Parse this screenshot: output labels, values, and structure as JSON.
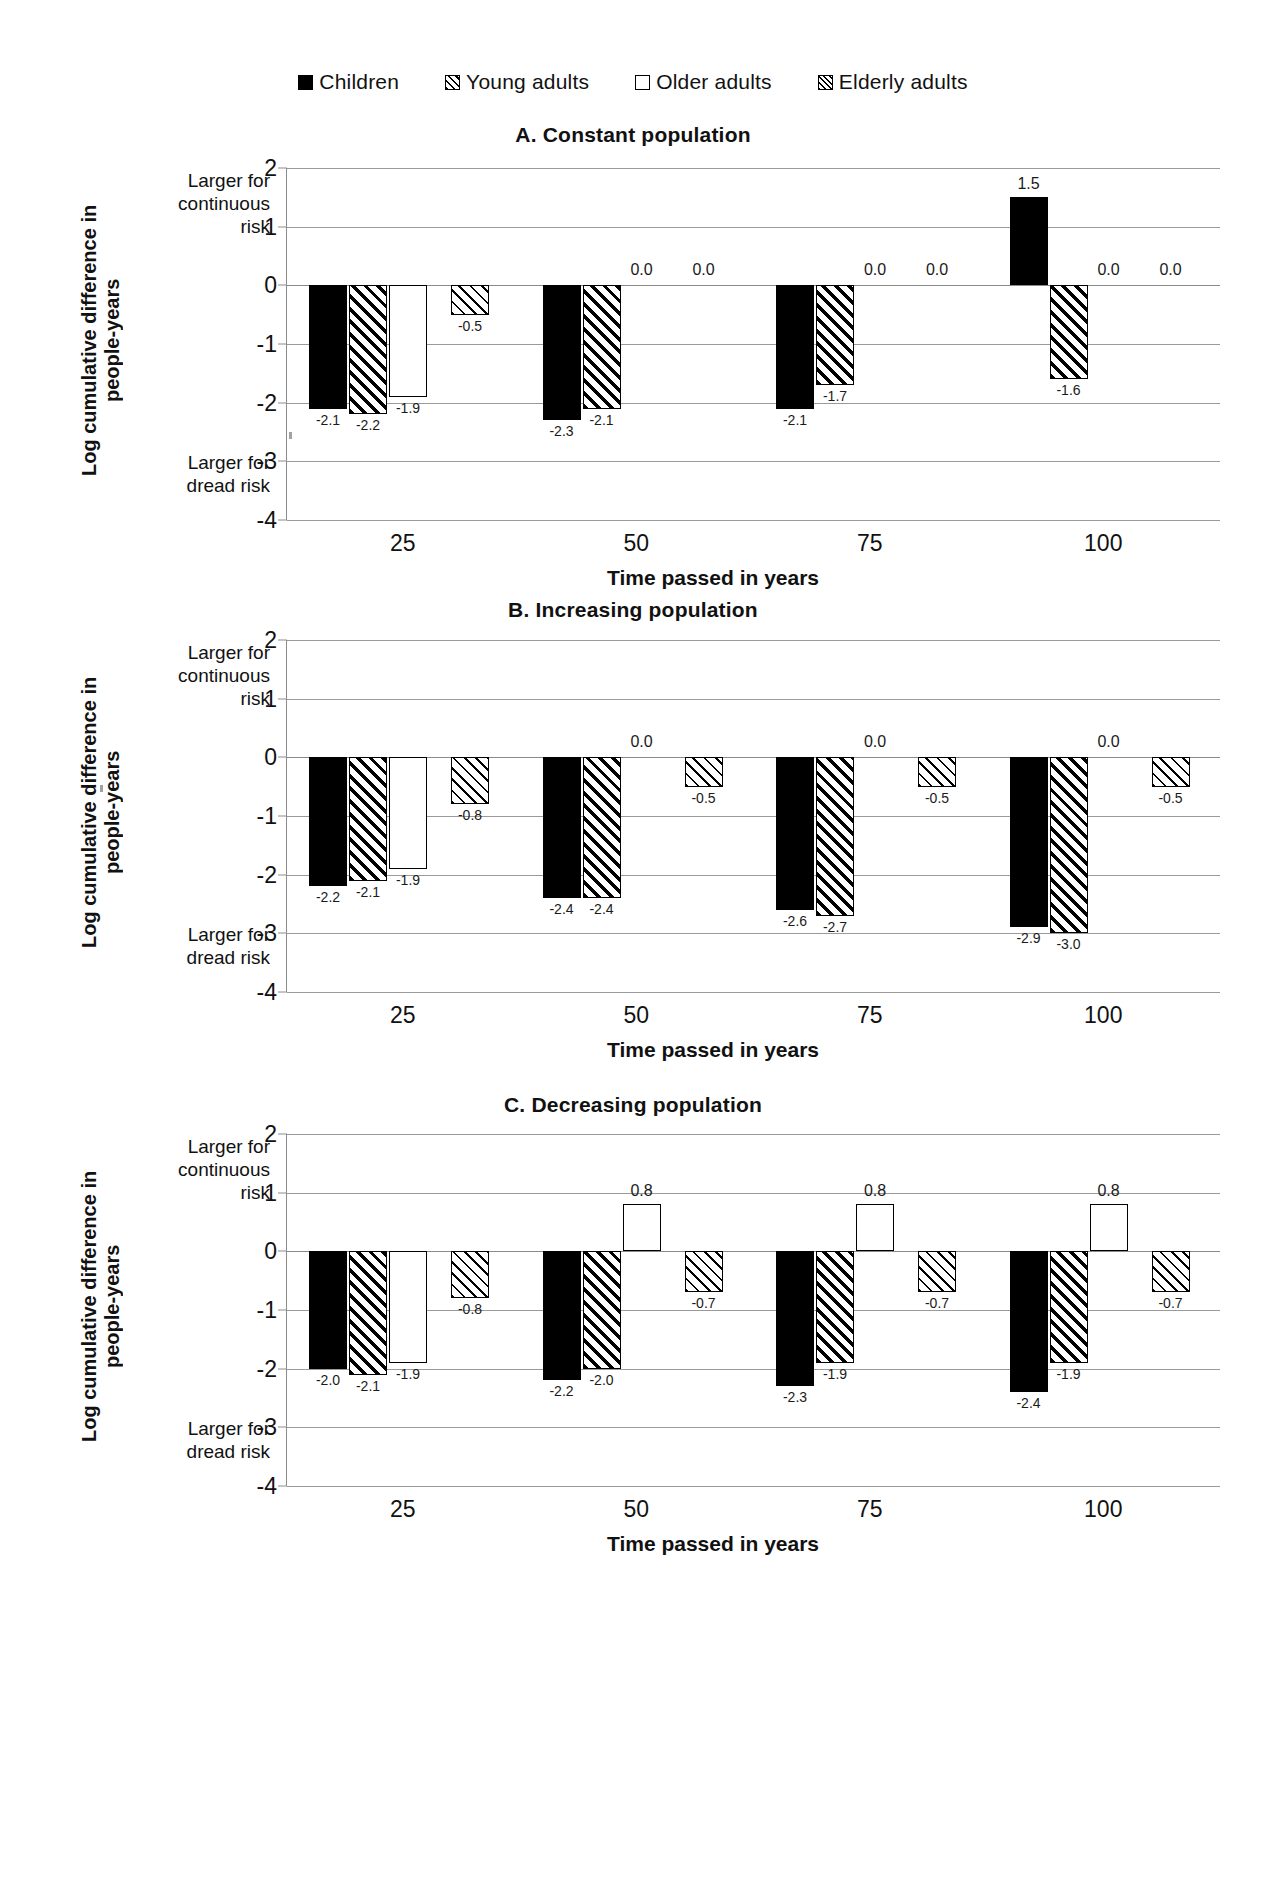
{
  "legend": {
    "items": [
      {
        "label": "Children",
        "pattern": "solid",
        "icon": "filled-square-icon"
      },
      {
        "label": "Young adults",
        "pattern": "diag",
        "icon": "diagonal-hatch-square-icon"
      },
      {
        "label": "Older adults",
        "pattern": "open",
        "icon": "empty-square-icon"
      },
      {
        "label": "Elderly adults",
        "pattern": "cross",
        "icon": "cross-hatch-square-icon"
      }
    ]
  },
  "axis": {
    "y_title": "Log cumulative difference in\npeople-years",
    "x_title": "Time passed in years",
    "top_annotation": "Larger for\ncontinuous\nrisk",
    "bottom_annotation": "Larger for\ndread risk",
    "yticks": [
      "2",
      "1",
      "0",
      "-1",
      "-2",
      "-3",
      "-4"
    ],
    "ytick_values": [
      2,
      1,
      0,
      -1,
      -2,
      -3,
      -4
    ],
    "xticks": [
      "25",
      "50",
      "75",
      "100"
    ]
  },
  "chart_data": [
    {
      "type": "bar",
      "panel": "A",
      "title": "A. Constant population",
      "categories": [
        "25",
        "50",
        "75",
        "100"
      ],
      "xlabel": "Time passed in years",
      "ylabel": "Log cumulative difference in people-years",
      "ylim": [
        -4,
        2
      ],
      "grid": true,
      "legend_position": "top",
      "series": [
        {
          "name": "Children",
          "pattern": "solid",
          "values": [
            -2.1,
            -2.3,
            -2.1,
            1.5
          ],
          "labels": [
            "-2.1",
            "-2.3",
            "-2.1",
            "1.5"
          ]
        },
        {
          "name": "Young adults",
          "pattern": "diag",
          "values": [
            -2.2,
            -2.1,
            -1.7,
            -1.6
          ],
          "labels": [
            "-2.2",
            "-2.1",
            "-1.7",
            "-1.6"
          ]
        },
        {
          "name": "Older adults",
          "pattern": "open",
          "values": [
            -1.9,
            0.0,
            0.0,
            0.0
          ],
          "labels": [
            "-1.9",
            "0.0",
            "0.0",
            "0.0"
          ]
        },
        {
          "name": "Elderly adults",
          "pattern": "cross",
          "values": [
            -0.5,
            0.0,
            0.0,
            0.0
          ],
          "labels": [
            "-0.5",
            "0.0",
            "0.0",
            "0.0"
          ]
        }
      ]
    },
    {
      "type": "bar",
      "panel": "B",
      "title": "B. Increasing population",
      "categories": [
        "25",
        "50",
        "75",
        "100"
      ],
      "xlabel": "Time passed in years",
      "ylabel": "Log cumulative difference in people-years",
      "ylim": [
        -4,
        2
      ],
      "grid": true,
      "legend_position": "top",
      "series": [
        {
          "name": "Children",
          "pattern": "solid",
          "values": [
            -2.2,
            -2.4,
            -2.6,
            -2.9
          ],
          "labels": [
            "-2.2",
            "-2.4",
            "-2.6",
            "-2.9"
          ]
        },
        {
          "name": "Young adults",
          "pattern": "diag",
          "values": [
            -2.1,
            -2.4,
            -2.7,
            -3.0
          ],
          "labels": [
            "-2.1",
            "-2.4",
            "-2.7",
            "-3.0"
          ]
        },
        {
          "name": "Older adults",
          "pattern": "open",
          "values": [
            -1.9,
            0.0,
            0.0,
            0.0
          ],
          "labels": [
            "-1.9",
            "0.0",
            "0.0",
            "0.0"
          ]
        },
        {
          "name": "Elderly adults",
          "pattern": "cross",
          "values": [
            -0.8,
            -0.5,
            -0.5,
            -0.5
          ],
          "labels": [
            "-0.8",
            "-0.5",
            "-0.5",
            "-0.5"
          ]
        }
      ]
    },
    {
      "type": "bar",
      "panel": "C",
      "title": "C. Decreasing population",
      "categories": [
        "25",
        "50",
        "75",
        "100"
      ],
      "xlabel": "Time passed in years",
      "ylabel": "Log cumulative difference in people-years",
      "ylim": [
        -4,
        2
      ],
      "grid": true,
      "legend_position": "top",
      "series": [
        {
          "name": "Children",
          "pattern": "solid",
          "values": [
            -2.0,
            -2.2,
            -2.3,
            -2.4
          ],
          "labels": [
            "-2.0",
            "-2.2",
            "-2.3",
            "-2.4"
          ]
        },
        {
          "name": "Young adults",
          "pattern": "diag",
          "values": [
            -2.1,
            -2.0,
            -1.9,
            -1.9
          ],
          "labels": [
            "-2.1",
            "-2.0",
            "-1.9",
            "-1.9"
          ]
        },
        {
          "name": "Older adults",
          "pattern": "open",
          "values": [
            -1.9,
            0.8,
            0.8,
            0.8
          ],
          "labels": [
            "-1.9",
            "0.8",
            "0.8",
            "0.8"
          ]
        },
        {
          "name": "Elderly adults",
          "pattern": "cross",
          "values": [
            -0.8,
            -0.7,
            -0.7,
            -0.7
          ],
          "labels": [
            "-0.8",
            "-0.7",
            "-0.7",
            "-0.7"
          ]
        }
      ]
    }
  ]
}
